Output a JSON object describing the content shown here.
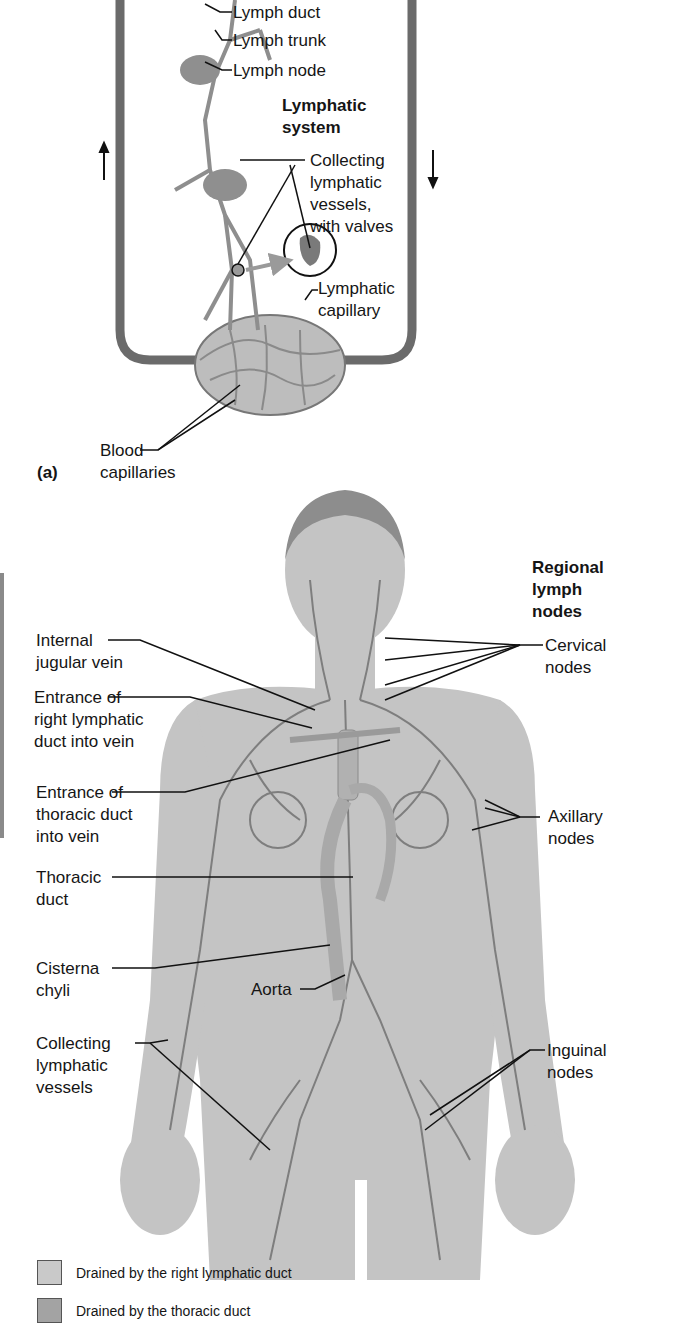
{
  "panel_a": {
    "letter": "(a)",
    "title_line1": "Lymphatic",
    "title_line2": "system",
    "labels": {
      "lymph_duct": "Lymph duct",
      "lymph_trunk": "Lymph trunk",
      "lymph_node": "Lymph node",
      "collecting_1": "Collecting",
      "collecting_2": "lymphatic",
      "collecting_3": "vessels,",
      "collecting_4": "with valves",
      "lymph_cap_1": "Lymphatic",
      "lymph_cap_2": "capillary",
      "blood_cap_1": "Blood",
      "blood_cap_2": "capillaries"
    }
  },
  "panel_b": {
    "regional_title_1": "Regional",
    "regional_title_2": "lymph",
    "regional_title_3": "nodes",
    "left_labels": {
      "internal_jugular_1": "Internal",
      "internal_jugular_2": "jugular vein",
      "right_duct_1": "Entrance of",
      "right_duct_2": "right lymphatic",
      "right_duct_3": "duct into vein",
      "thoracic_entr_1": "Entrance of",
      "thoracic_entr_2": "thoracic duct",
      "thoracic_entr_3": "into vein",
      "thoracic_duct_1": "Thoracic",
      "thoracic_duct_2": "duct",
      "cisterna_1": "Cisterna",
      "cisterna_2": "chyli",
      "collecting_1": "Collecting",
      "collecting_2": "lymphatic",
      "collecting_3": "vessels"
    },
    "center_labels": {
      "aorta": "Aorta"
    },
    "right_labels": {
      "cervical_1": "Cervical",
      "cervical_2": "nodes",
      "axillary_1": "Axillary",
      "axillary_2": "nodes",
      "inguinal_1": "Inguinal",
      "inguinal_2": "nodes"
    }
  },
  "legend": {
    "items": [
      {
        "label": "Drained by the right lymphatic duct",
        "color": "#c9c9c9"
      },
      {
        "label": "Drained by the thoracic duct",
        "color": "#a3a3a3"
      }
    ]
  }
}
